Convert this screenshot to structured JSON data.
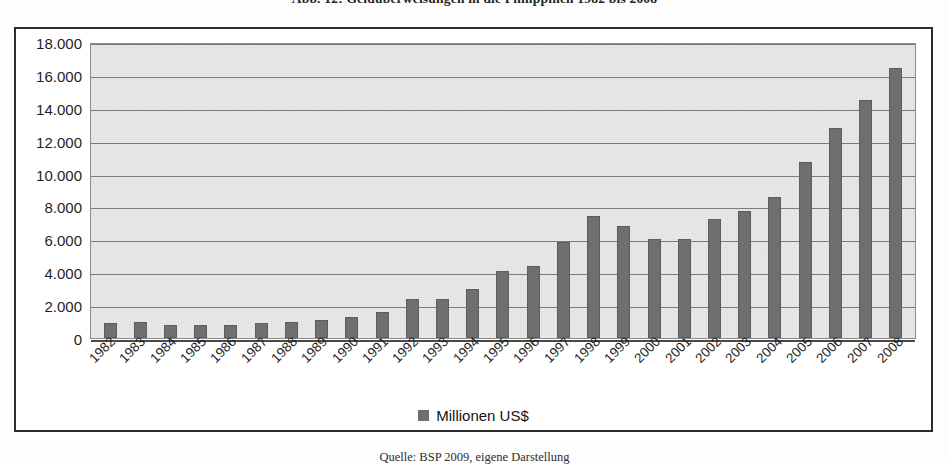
{
  "figure": {
    "title": "Abb. 12:  Geldüberweisungen in die Philippinen 1982 bis 2008",
    "source_note": "Quelle: BSP 2009, eigene Darstellung"
  },
  "legend": {
    "position": "bottom",
    "entries": [
      {
        "label": "Millionen US$",
        "color": "#6f6f6f",
        "marker": "square-swatch-icon"
      }
    ]
  },
  "colors": {
    "bar": "#6f6f6f",
    "plot_background": "#e9e9e9",
    "gridline": "#7d7d7d",
    "frame": "#2b2b2b",
    "text": "#1f1f1f"
  },
  "chart_data": {
    "type": "bar",
    "title": "Abb. 12:  Geldüberweisungen in die Philippinen 1982 bis 2008",
    "xlabel": "",
    "ylabel": "",
    "ylim": [
      0,
      18000
    ],
    "ytick_step": 2000,
    "grid": true,
    "number_format": "de-DE (period as thousands separator)",
    "ytick_labels": [
      "18.000",
      "16.000",
      "14.000",
      "12.000",
      "10.000",
      "8.000",
      "6.000",
      "4.000",
      "2.000",
      "0"
    ],
    "yticks": [
      18000,
      16000,
      14000,
      12000,
      10000,
      8000,
      6000,
      4000,
      2000,
      0
    ],
    "categories": [
      "1982",
      "1983",
      "1984",
      "1985",
      "1986",
      "1987",
      "1988",
      "1989",
      "1990",
      "1991",
      "1992",
      "1993",
      "1994",
      "1995",
      "1996",
      "1997",
      "1998",
      "1999",
      "2000",
      "2001",
      "2002",
      "2003",
      "2004",
      "2005",
      "2006",
      "2007",
      "2008"
    ],
    "series": [
      {
        "name": "Millionen US$",
        "color": "#6f6f6f",
        "values": [
          900,
          1000,
          800,
          800,
          800,
          900,
          1000,
          1100,
          1300,
          1600,
          2400,
          2350,
          3000,
          4050,
          4400,
          5850,
          7400,
          6800,
          6050,
          6050,
          7250,
          7750,
          8550,
          10700,
          12800,
          14500,
          16400
        ]
      }
    ]
  }
}
